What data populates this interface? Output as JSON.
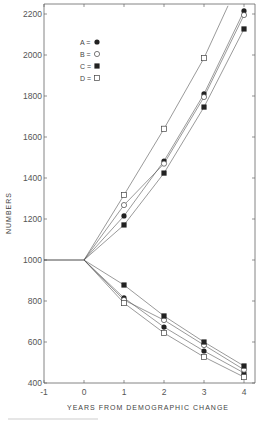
{
  "chart_data": {
    "type": "line",
    "title": "",
    "xlabel": "YEARS FROM DEMOGRAPHIC CHANGE",
    "ylabel": "NUMBERS",
    "xlim": [
      -1,
      4.25
    ],
    "ylim": [
      400,
      2240
    ],
    "xticks": [
      -1,
      0,
      1,
      2,
      3,
      4
    ],
    "yticks": [
      400,
      600,
      800,
      1000,
      1200,
      1400,
      1600,
      1800,
      2000,
      2200
    ],
    "grid": false,
    "legend": {
      "placement": "top-left",
      "entries": [
        {
          "label": "A =",
          "marker": "filled-circle"
        },
        {
          "label": "B =",
          "marker": "open-circle"
        },
        {
          "label": "C =",
          "marker": "filled-square"
        },
        {
          "label": "D =",
          "marker": "open-square"
        }
      ]
    },
    "baseline": {
      "x": [
        -1,
        0
      ],
      "y": [
        1000,
        1000
      ]
    },
    "series": [
      {
        "name": "A",
        "branch": "increase",
        "marker": "filled-circle",
        "x": [
          0,
          1,
          2,
          3,
          4
        ],
        "y": [
          1000,
          1215,
          1483,
          1810,
          2215
        ]
      },
      {
        "name": "B",
        "branch": "increase",
        "marker": "open-circle",
        "x": [
          0,
          1,
          2,
          3,
          4
        ],
        "y": [
          1000,
          1268,
          1470,
          1795,
          2195
        ]
      },
      {
        "name": "C",
        "branch": "increase",
        "marker": "filled-square",
        "x": [
          0,
          1,
          2,
          3,
          4
        ],
        "y": [
          1000,
          1171,
          1424,
          1746,
          2127
        ]
      },
      {
        "name": "D",
        "branch": "increase",
        "marker": "open-square",
        "x": [
          0,
          1,
          2,
          3,
          3.6
        ],
        "y": [
          1000,
          1317,
          1640,
          1985,
          2240
        ],
        "note": "line exits top of plot"
      },
      {
        "name": "A",
        "branch": "decrease",
        "marker": "filled-circle",
        "x": [
          0,
          1,
          2,
          3,
          4
        ],
        "y": [
          1000,
          815,
          673,
          556,
          449
        ]
      },
      {
        "name": "B",
        "branch": "decrease",
        "marker": "open-circle",
        "x": [
          0,
          1,
          2,
          3,
          4
        ],
        "y": [
          1000,
          805,
          707,
          585,
          465
        ]
      },
      {
        "name": "C",
        "branch": "decrease",
        "marker": "filled-square",
        "x": [
          0,
          1,
          2,
          3,
          4
        ],
        "y": [
          1000,
          878,
          727,
          600,
          483
        ]
      },
      {
        "name": "D",
        "branch": "decrease",
        "marker": "open-square",
        "x": [
          0,
          1,
          2,
          3,
          4
        ],
        "y": [
          1000,
          790,
          644,
          527,
          429
        ]
      }
    ]
  }
}
